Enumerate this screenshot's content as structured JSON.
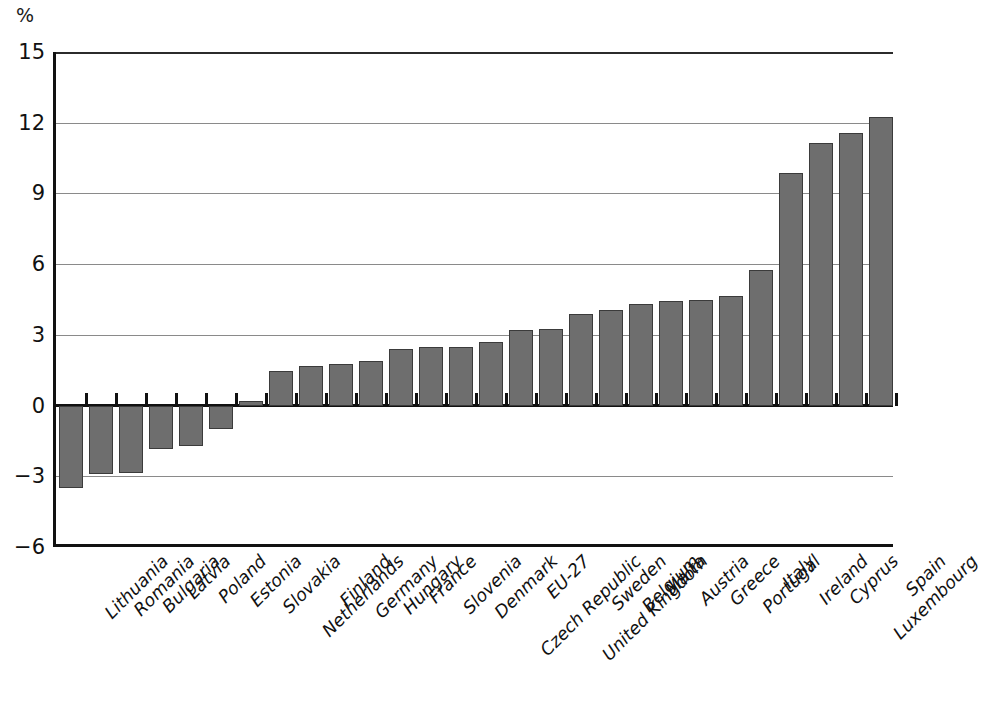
{
  "chart": {
    "unit_label": "%",
    "y_axis": {
      "ticks": [
        "15",
        "12",
        "9",
        "6",
        "3",
        "0",
        "-3",
        "-6"
      ]
    }
  },
  "chart_data": {
    "type": "bar",
    "title": "",
    "xlabel": "",
    "ylabel": "%",
    "ylim": [
      -6,
      15
    ],
    "yticks": [
      -6,
      -3,
      0,
      3,
      6,
      9,
      12,
      15
    ],
    "grid": true,
    "legend": "none",
    "orientation": "vertical",
    "bar_color": "#6e6e6e",
    "bar_edge_color": "#3b3b3b",
    "categories": [
      "Lithuania",
      "Romania",
      "Bulgaria",
      "Latvia",
      "Poland",
      "Estonia",
      "Slovakia",
      "Netherlands",
      "Finland",
      "Germany",
      "Hungary",
      "France",
      "Slovenia",
      "Denmark",
      "Czech Republic",
      "EU-27",
      "United Kingdom",
      "Sweden",
      "Belgium",
      "Malta",
      "Austria",
      "Greece",
      "Portugal",
      "Italy",
      "Ireland",
      "Cyprus",
      "Luxembourg",
      "Spain"
    ],
    "values": [
      -3.5,
      -2.9,
      -2.85,
      -1.85,
      -1.7,
      -1.0,
      0.2,
      1.45,
      1.7,
      1.75,
      1.9,
      2.4,
      2.5,
      2.5,
      2.7,
      3.2,
      3.25,
      3.9,
      4.05,
      4.3,
      4.45,
      4.5,
      4.65,
      5.75,
      9.85,
      11.15,
      11.55,
      12.25
    ]
  }
}
